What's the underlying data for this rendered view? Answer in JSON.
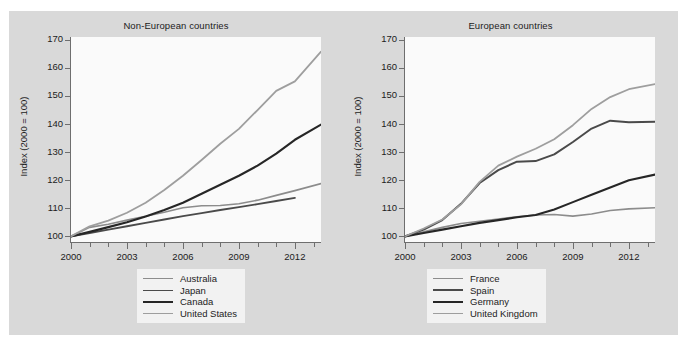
{
  "figure": {
    "background_color": "#d9d9d9",
    "plot_background_color": "#fafafa",
    "axis_color": "#6e6e6e"
  },
  "chart_data": [
    {
      "type": "line",
      "title": "Non-European countries",
      "xlabel": "",
      "ylabel": "Index (2000 = 100)",
      "xlim": [
        2000,
        2013.4
      ],
      "ylim": [
        98,
        171
      ],
      "yticks": [
        100,
        110,
        120,
        130,
        140,
        150,
        160,
        170
      ],
      "xticks": [
        2000,
        2001,
        2002,
        2003,
        2004,
        2005,
        2006,
        2007,
        2008,
        2009,
        2010,
        2011,
        2012,
        2013
      ],
      "xticklabels": [
        "2000",
        "2003",
        "2006",
        "2009",
        "2012"
      ],
      "xticklabel_values": [
        2000,
        2003,
        2006,
        2009,
        2012
      ],
      "grid": false,
      "legend_position": "bottom-center",
      "x": [
        2000,
        2001,
        2002,
        2003,
        2004,
        2005,
        2006,
        2007,
        2008,
        2009,
        2010,
        2011,
        2012,
        2013.4
      ],
      "series": [
        {
          "name": "Australia",
          "color": "#8c8c8c",
          "width": 1.6,
          "values": [
            100.0,
            103.2,
            104.3,
            105.8,
            107.2,
            108.6,
            110.2,
            110.9,
            111.0,
            111.6,
            112.9,
            114.6,
            116.3,
            118.8
          ]
        },
        {
          "name": "Japan",
          "color": "#4a4a4a",
          "width": 1.9,
          "values": [
            100.0,
            101.2,
            102.4,
            103.6,
            104.8,
            106.0,
            107.2,
            108.3,
            109.4,
            110.4,
            111.5,
            112.6,
            113.7,
            null
          ]
        },
        {
          "name": "Canada",
          "color": "#262626",
          "width": 2.1,
          "values": [
            100.0,
            101.6,
            103.3,
            105.0,
            107.1,
            109.4,
            112.0,
            115.2,
            118.4,
            121.6,
            125.2,
            129.5,
            134.4,
            139.8
          ]
        },
        {
          "name": "United States",
          "color": "#9e9e9e",
          "width": 1.8,
          "values": [
            100.0,
            103.6,
            105.6,
            108.4,
            112.0,
            116.5,
            121.6,
            127.2,
            133.0,
            138.3,
            145.0,
            151.8,
            155.2,
            165.8
          ]
        }
      ]
    },
    {
      "type": "line",
      "title": "European countries",
      "xlabel": "",
      "ylabel": "Index (2000 = 100)",
      "xlim": [
        2000,
        2013.4
      ],
      "ylim": [
        98,
        171
      ],
      "yticks": [
        100,
        110,
        120,
        130,
        140,
        150,
        160,
        170
      ],
      "xticks": [
        2000,
        2001,
        2002,
        2003,
        2004,
        2005,
        2006,
        2007,
        2008,
        2009,
        2010,
        2011,
        2012,
        2013
      ],
      "xticklabels": [
        "2000",
        "2003",
        "2006",
        "2009",
        "2012"
      ],
      "xticklabel_values": [
        2000,
        2003,
        2006,
        2009,
        2012
      ],
      "grid": false,
      "legend_position": "bottom-center",
      "x": [
        2000,
        2001,
        2002,
        2003,
        2004,
        2005,
        2006,
        2007,
        2008,
        2009,
        2010,
        2011,
        2012,
        2013.4
      ],
      "series": [
        {
          "name": "France",
          "color": "#8c8c8c",
          "width": 1.6,
          "values": [
            100.0,
            101.6,
            103.2,
            104.6,
            105.4,
            106.2,
            107.0,
            107.6,
            107.8,
            107.2,
            108.0,
            109.2,
            109.8,
            110.2
          ]
        },
        {
          "name": "Spain",
          "color": "#4a4a4a",
          "width": 2.0,
          "values": [
            100.0,
            102.4,
            105.8,
            111.6,
            119.0,
            123.6,
            126.6,
            126.8,
            129.2,
            133.6,
            138.4,
            141.2,
            140.6,
            140.8
          ]
        },
        {
          "name": "Germany",
          "color": "#262626",
          "width": 2.1,
          "values": [
            100.0,
            101.2,
            102.4,
            103.6,
            104.8,
            105.8,
            106.8,
            107.6,
            109.6,
            112.2,
            114.8,
            117.4,
            120.0,
            122.0
          ]
        },
        {
          "name": "United Kingdom",
          "color": "#9e9e9e",
          "width": 1.8,
          "values": [
            100.0,
            102.8,
            106.0,
            111.4,
            119.4,
            125.2,
            128.4,
            131.2,
            134.6,
            139.6,
            145.4,
            149.6,
            152.4,
            154.2
          ]
        }
      ]
    }
  ]
}
